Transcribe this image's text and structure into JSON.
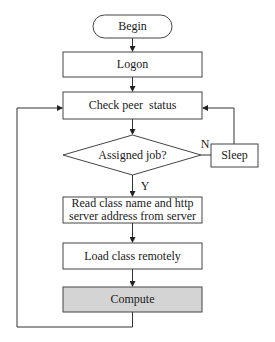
{
  "diagram": {
    "type": "flowchart",
    "nodes": {
      "begin": {
        "label": "Begin",
        "shape": "terminal"
      },
      "logon": {
        "label": "Logon",
        "shape": "process"
      },
      "check": {
        "label": "Check peer  status",
        "shape": "process"
      },
      "decision": {
        "label": "Assigned job?",
        "shape": "decision"
      },
      "sleep": {
        "label": "Sleep",
        "shape": "process"
      },
      "read": {
        "label_line1": "Read class name and http",
        "label_line2": "server address from server",
        "shape": "process"
      },
      "load": {
        "label": "Load class remotely",
        "shape": "process"
      },
      "compute": {
        "label": "Compute",
        "shape": "process",
        "fill": "#d4d4d4"
      }
    },
    "edge_labels": {
      "no": "N",
      "yes": "Y"
    },
    "colors": {
      "stroke": "#444444",
      "text": "#1a1a1a",
      "highlight_fill": "#d4d4d4"
    }
  }
}
